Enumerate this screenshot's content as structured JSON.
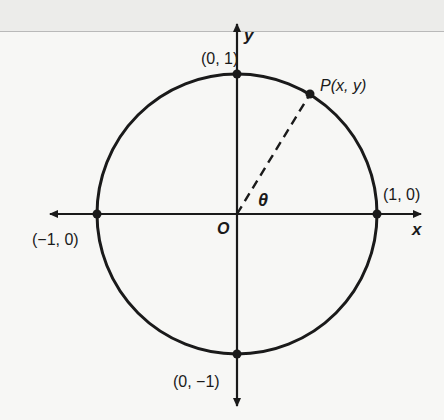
{
  "figure": {
    "type": "unit-circle",
    "axes": {
      "x_label": "x",
      "y_label": "y",
      "origin_label": "O"
    },
    "points": [
      {
        "id": "top",
        "label": "(0, 1)"
      },
      {
        "id": "right",
        "label": "(1, 0)"
      },
      {
        "id": "bottom",
        "label": "(0, −1)"
      },
      {
        "id": "left",
        "label": "(−1, 0)"
      },
      {
        "id": "p",
        "label_name": "P",
        "label_coords": "(x, y)"
      }
    ],
    "angle_label": "θ",
    "colors": {
      "stroke": "#1a1a1a",
      "background": "#f7f7f5"
    }
  }
}
